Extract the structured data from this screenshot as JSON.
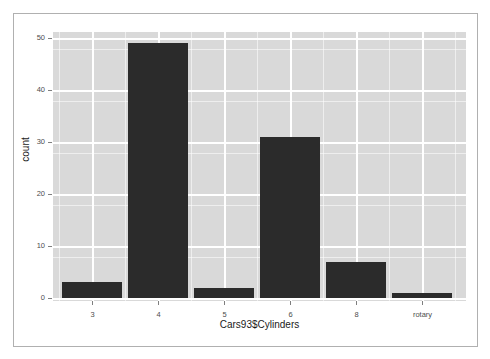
{
  "chart_data": {
    "type": "bar",
    "title": "",
    "subtitle": "",
    "xlabel": "Cars93$Cylinders",
    "ylabel": "count",
    "categories": [
      "3",
      "4",
      "5",
      "6",
      "8",
      "rotary"
    ],
    "values": [
      3,
      49,
      2,
      31,
      7,
      1
    ],
    "series": [
      {
        "name": "count",
        "values": [
          3,
          49,
          2,
          31,
          7,
          1
        ]
      }
    ],
    "ylim": [
      0,
      51
    ],
    "y_ticks": [
      0,
      10,
      20,
      30,
      40,
      50
    ],
    "y_tick_labels": [
      "0",
      "10",
      "20",
      "30",
      "40",
      "50"
    ],
    "y_minor_ticks": [
      5,
      15,
      25,
      35,
      45
    ],
    "x_tick_labels": [
      "3",
      "4",
      "5",
      "6",
      "8",
      "rotary"
    ],
    "grid": true,
    "legend": false,
    "legend_position": "none",
    "colors": {
      "bar": "#2b2b2b",
      "panel_background": "#d9d9d9",
      "gridline": "#ffffff",
      "axis_text": "#4d4d4d",
      "axis_title": "#1a1a1a",
      "figure_background": "#ffffff",
      "frame_border": "#b0b0b0"
    }
  }
}
